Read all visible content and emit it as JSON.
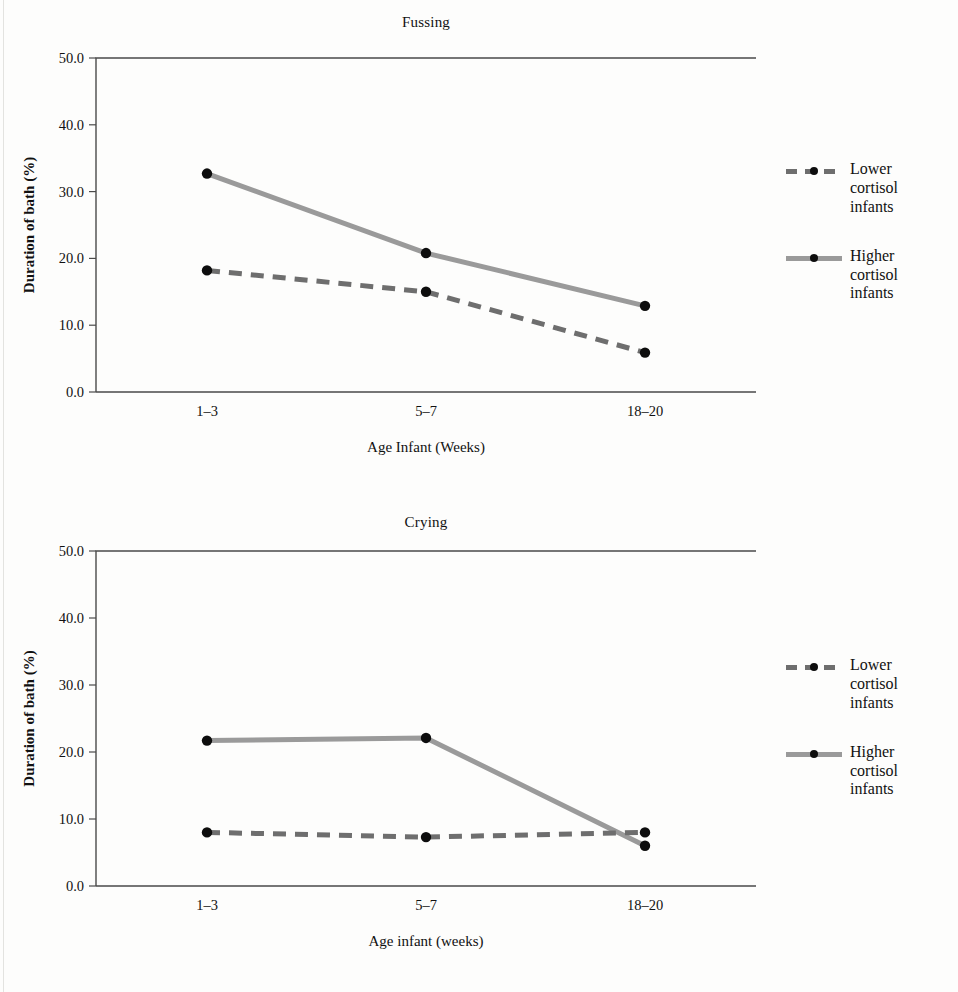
{
  "figure": {
    "background": "#fdfdfc",
    "ink": "#111111",
    "axis_color": "#4a4a4a"
  },
  "legend": {
    "position": "right",
    "entries": [
      {
        "name": "Lower cortisol infants",
        "line1": "Lower",
        "line2": "cortisol",
        "line3": "infants",
        "style": "dashed",
        "color": "#6e6e6e",
        "marker": "filled-circle",
        "marker_color": "#0d0d0d"
      },
      {
        "name": "Higher cortisol infants",
        "line1": "Higher",
        "line2": "cortisol",
        "line3": "infants",
        "style": "solid",
        "color": "#9a9a9a",
        "marker": "filled-circle",
        "marker_color": "#0d0d0d"
      }
    ]
  },
  "chart_data": [
    {
      "id": "fussing",
      "type": "line",
      "title": "Fussing",
      "xlabel": "Age Infant (Weeks)",
      "ylabel": "Duration of bath (%)",
      "categories": [
        "1–3",
        "5–7",
        "18–20"
      ],
      "ylim": [
        0.0,
        50.0
      ],
      "yticks": [
        0.0,
        10.0,
        20.0,
        30.0,
        40.0,
        50.0
      ],
      "ytick_labels": [
        "0.0",
        "10.0",
        "20.0",
        "30.0",
        "40.0",
        "50.0"
      ],
      "grid": false,
      "legend_position": "right",
      "series": [
        {
          "name": "Lower cortisol infants",
          "style": "dashed",
          "color": "#6e6e6e",
          "values": [
            18.2,
            15.0,
            5.9
          ]
        },
        {
          "name": "Higher cortisol infants",
          "style": "solid",
          "color": "#9a9a9a",
          "values": [
            32.7,
            20.8,
            12.9
          ]
        }
      ]
    },
    {
      "id": "crying",
      "type": "line",
      "title": "Crying",
      "xlabel": "Age infant (weeks)",
      "ylabel": "Duration of bath (%)",
      "categories": [
        "1–3",
        "5–7",
        "18–20"
      ],
      "ylim": [
        0.0,
        50.0
      ],
      "yticks": [
        0.0,
        10.0,
        20.0,
        30.0,
        40.0,
        50.0
      ],
      "ytick_labels": [
        "0.0",
        "10.0",
        "20.0",
        "30.0",
        "40.0",
        "50.0"
      ],
      "grid": false,
      "legend_position": "right",
      "series": [
        {
          "name": "Lower cortisol infants",
          "style": "dashed",
          "color": "#6e6e6e",
          "values": [
            8.0,
            7.3,
            8.0
          ]
        },
        {
          "name": "Higher cortisol infants",
          "style": "solid",
          "color": "#9a9a9a",
          "values": [
            21.7,
            22.1,
            6.0
          ]
        }
      ]
    }
  ]
}
